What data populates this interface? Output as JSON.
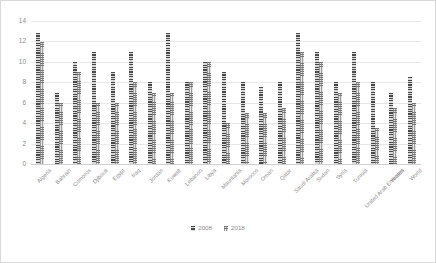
{
  "chart_data": {
    "type": "bar",
    "title": "",
    "xlabel": "",
    "ylabel": "",
    "ylim": [
      0,
      14
    ],
    "yticks": [
      0,
      2,
      4,
      6,
      8,
      10,
      12,
      14
    ],
    "grid": true,
    "legend_position": "bottom",
    "categories": [
      "Algeria",
      "Bahrain",
      "Comoros",
      "Djibouti",
      "Egypt",
      "Iraq",
      "Jordan",
      "Kuwait",
      "Lebanon",
      "Libya",
      "Mauritania",
      "Morocco",
      "Oman",
      "Qatar",
      "Saudi Arabia",
      "Sudan",
      "Syria",
      "Tunisia",
      "United Arab Emirates",
      "Yemen",
      "World"
    ],
    "series": [
      {
        "name": "2008",
        "values": [
          12.8,
          7.0,
          10.0,
          11.0,
          9.0,
          11.0,
          8.0,
          12.8,
          8.0,
          10.0,
          9.0,
          8.0,
          7.5,
          8.0,
          12.8,
          11.0,
          8.0,
          11.0,
          8.0,
          7.0,
          8.5
        ]
      },
      {
        "name": "2018",
        "values": [
          11.9,
          6.0,
          9.0,
          6.0,
          6.0,
          8.0,
          7.0,
          7.0,
          8.0,
          10.0,
          4.0,
          5.0,
          5.0,
          5.5,
          11.0,
          10.0,
          7.0,
          8.0,
          3.5,
          5.5,
          6.0
        ]
      }
    ],
    "colors": {
      "series_2008": "#4a4a4a",
      "series_2018": "#9e9e9e",
      "gridline": "#e8e8e8",
      "axis_text": "#8c8c8c",
      "border": "#d9d9d9",
      "background": "#ffffff"
    }
  }
}
